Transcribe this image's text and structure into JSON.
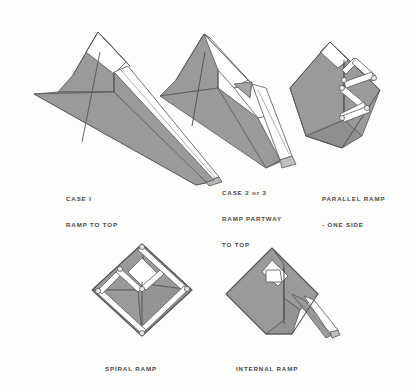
{
  "sheet": {
    "title": "Pyramid Ramp Construction Theories",
    "background_color": "#fdfdfc",
    "ink_color": "#4a4a4a",
    "fill_gray": "#9a9a9a",
    "fill_gray_dark": "#8c8c8c",
    "fill_gray_light": "#ababab",
    "fill_white": "#ffffff",
    "line_color": "#555555"
  },
  "diagrams": [
    {
      "id": "case-1",
      "name": "case-1-ramp-to-top",
      "caption_lines": [
        "CASE I",
        "RAMP TO TOP"
      ],
      "caption_x": 66,
      "caption_y": 178,
      "description": "Pyramid with a single long straight ramp running all the way to the top",
      "ramp_type": "straight-full-height"
    },
    {
      "id": "case-2-or-3",
      "name": "case-2-or-3-ramp-partway-to-top",
      "caption_lines": [
        "CASE 2 or 3",
        "RAMP PARTWAY",
        "TO TOP"
      ],
      "caption_x": 222,
      "caption_y": 172,
      "description": "Pyramid with a straight ramp reaching only partway up the side",
      "ramp_type": "straight-partial-height"
    },
    {
      "id": "parallel-ramp",
      "name": "parallel-ramp-one-side",
      "caption_lines": [
        "PARALLEL RAMP",
        "- ONE SIDE"
      ],
      "caption_x": 322,
      "caption_y": 178,
      "description": "Pyramid with zigzag switchback ramps on a single face",
      "ramp_type": "zigzag-switchback-one-face"
    },
    {
      "id": "spiral-ramp",
      "name": "spiral-ramp",
      "caption_lines": [
        "SPIRAL RAMP"
      ],
      "caption_x": 105,
      "caption_y": 348,
      "description": "Pyramid with a ramp spiralling around all four faces",
      "ramp_type": "spiral-around-faces"
    },
    {
      "id": "internal-ramp",
      "name": "internal-ramp",
      "caption_lines": [
        "INTERNAL RAMP"
      ],
      "caption_x": 236,
      "caption_y": 348,
      "description": "Pyramid with an internal ramp and a short external approach ramp",
      "ramp_type": "internal-with-external-stub"
    }
  ]
}
